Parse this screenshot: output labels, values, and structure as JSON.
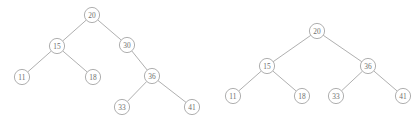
{
  "figure": {
    "name": "binary-search-tree-deletion-pair",
    "width": 420,
    "height": 129,
    "background_color": "#ffffff",
    "node_stroke_color": "#9a9a9a",
    "node_fill_color": "#ffffff",
    "edge_color": "#9a9a9a",
    "label_color": "#6e6e6e",
    "node_radius": 7.6
  },
  "chart_data": {
    "type": "diagram",
    "subtype": "binary-search-tree",
    "title": "",
    "panels": [
      {
        "id": "left-tree",
        "caption": "",
        "root": "20",
        "nodes": [
          {
            "id": "L20",
            "label": "20",
            "x": 92,
            "y": 15,
            "level": 0
          },
          {
            "id": "L15",
            "label": "15",
            "x": 57,
            "y": 46,
            "level": 1
          },
          {
            "id": "L30",
            "label": "30",
            "x": 127,
            "y": 45,
            "level": 1
          },
          {
            "id": "L11",
            "label": "11",
            "x": 22,
            "y": 77,
            "level": 2
          },
          {
            "id": "L18",
            "label": "18",
            "x": 93,
            "y": 77,
            "level": 2
          },
          {
            "id": "L36",
            "label": "36",
            "x": 152,
            "y": 76,
            "level": 2
          },
          {
            "id": "L33",
            "label": "33",
            "x": 122,
            "y": 107,
            "level": 3
          },
          {
            "id": "L41",
            "label": "41",
            "x": 192,
            "y": 107,
            "level": 3
          }
        ],
        "edges": [
          {
            "from": "L20",
            "to": "L15",
            "side": "left"
          },
          {
            "from": "L20",
            "to": "L30",
            "side": "right"
          },
          {
            "from": "L15",
            "to": "L11",
            "side": "left"
          },
          {
            "from": "L15",
            "to": "L18",
            "side": "right"
          },
          {
            "from": "L30",
            "to": "L36",
            "side": "right"
          },
          {
            "from": "L36",
            "to": "L33",
            "side": "left"
          },
          {
            "from": "L36",
            "to": "L41",
            "side": "right"
          }
        ]
      },
      {
        "id": "right-tree",
        "caption": "",
        "root": "20",
        "nodes": [
          {
            "id": "R20",
            "label": "20",
            "x": 317,
            "y": 31,
            "level": 0
          },
          {
            "id": "R15",
            "label": "15",
            "x": 267,
            "y": 66,
            "level": 1
          },
          {
            "id": "R36",
            "label": "36",
            "x": 368,
            "y": 66,
            "level": 1
          },
          {
            "id": "R11",
            "label": "11",
            "x": 233,
            "y": 96,
            "level": 2
          },
          {
            "id": "R18",
            "label": "18",
            "x": 302,
            "y": 96,
            "level": 2
          },
          {
            "id": "R33",
            "label": "33",
            "x": 336,
            "y": 96,
            "level": 2
          },
          {
            "id": "R41",
            "label": "41",
            "x": 403,
            "y": 96,
            "level": 2
          }
        ],
        "edges": [
          {
            "from": "R20",
            "to": "R15",
            "side": "left"
          },
          {
            "from": "R20",
            "to": "R36",
            "side": "right"
          },
          {
            "from": "R15",
            "to": "R11",
            "side": "left"
          },
          {
            "from": "R15",
            "to": "R18",
            "side": "right"
          },
          {
            "from": "R36",
            "to": "R33",
            "side": "left"
          },
          {
            "from": "R36",
            "to": "R41",
            "side": "right"
          }
        ]
      }
    ]
  }
}
